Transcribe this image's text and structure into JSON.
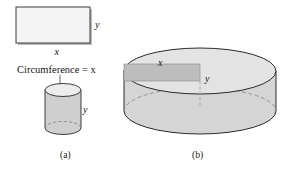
{
  "figure": {
    "colors": {
      "outline": "#1a1a1a",
      "rect_fill": "#f2f2f2",
      "rect_shadow": "#b9b9b9",
      "cylinder_body": "#d2d2d2",
      "cylinder_top": "#e8e8e8",
      "inner_rect_fill": "#b9b9b9",
      "dashed_line": "#8a8a8a",
      "text": "#151515",
      "background": "#ffffff"
    },
    "panel_a": {
      "caption": "(a)",
      "rectangle": {
        "width_label": "x",
        "height_label": "y"
      },
      "note": "Circumference = x",
      "cylinder": {
        "height_label": "y"
      }
    },
    "panel_b": {
      "caption": "(b)",
      "cylinder": {
        "width_label": "x",
        "height_label": "y"
      }
    }
  }
}
